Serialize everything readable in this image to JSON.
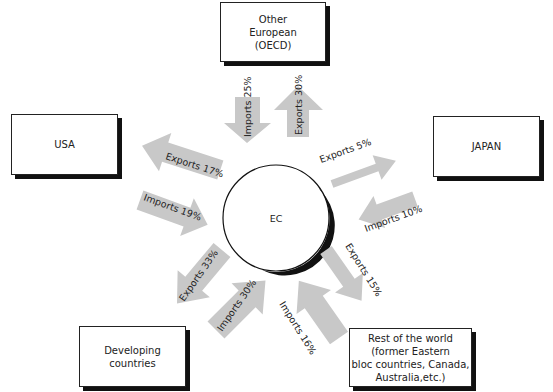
{
  "center": {
    "label": "EC"
  },
  "regions": {
    "oecd": {
      "line1": "Other",
      "line2": "European",
      "line3": "(OECD)"
    },
    "usa": {
      "label": "USA"
    },
    "japan": {
      "label": "JAPAN"
    },
    "developing": {
      "line1": "Developing",
      "line2": "countries"
    },
    "rest": {
      "line1": "Rest of the world",
      "line2": "(former Eastern",
      "line3": "bloc countries, Canada,",
      "line4": "Australia,etc.)"
    }
  },
  "flows": {
    "oecd_imports": "Imports 25%",
    "oecd_exports": "Exports 30%",
    "usa_exports": "Exports 17%",
    "usa_imports": "Imports 19%",
    "japan_exports": "Exports 5%",
    "japan_imports": "Imports 10%",
    "dev_exports": "Exports 33%",
    "dev_imports": "Imports 30%",
    "rest_imports": "Imports 16%",
    "rest_exports": "Exports 15%"
  },
  "colors": {
    "arrow": "#c8c8c8",
    "border": "#222222",
    "shadow": "#111111"
  }
}
